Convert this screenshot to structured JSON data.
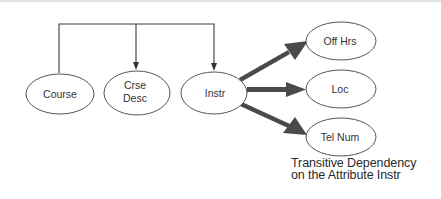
{
  "diagram": {
    "type": "functional-dependency",
    "nodes": [
      {
        "id": "course",
        "label_lines": [
          "Course"
        ]
      },
      {
        "id": "crse_desc",
        "label_lines": [
          "Crse",
          "Desc"
        ]
      },
      {
        "id": "instr",
        "label_lines": [
          "Instr"
        ]
      },
      {
        "id": "off_hrs",
        "label_lines": [
          "Off Hrs"
        ]
      },
      {
        "id": "loc",
        "label_lines": [
          "Loc"
        ]
      },
      {
        "id": "tel_num",
        "label_lines": [
          "Tel Num"
        ]
      }
    ],
    "edges": [
      {
        "from": "course",
        "to": "crse_desc",
        "style": "thin-bracket-arrow"
      },
      {
        "from": "course",
        "to": "instr",
        "style": "thin-bracket-arrow"
      },
      {
        "from": "instr",
        "to": "off_hrs",
        "style": "thick-arrow"
      },
      {
        "from": "instr",
        "to": "loc",
        "style": "thick-arrow"
      },
      {
        "from": "instr",
        "to": "tel_num",
        "style": "thick-arrow"
      }
    ],
    "caption": {
      "line1": "Transitive Dependency",
      "line2": "on the Attribute Instr"
    },
    "colors": {
      "line": "#3a3a3a",
      "thick_arrow": "#4a4a4a",
      "ellipse_stroke": "#555555",
      "text": "#333333"
    }
  }
}
